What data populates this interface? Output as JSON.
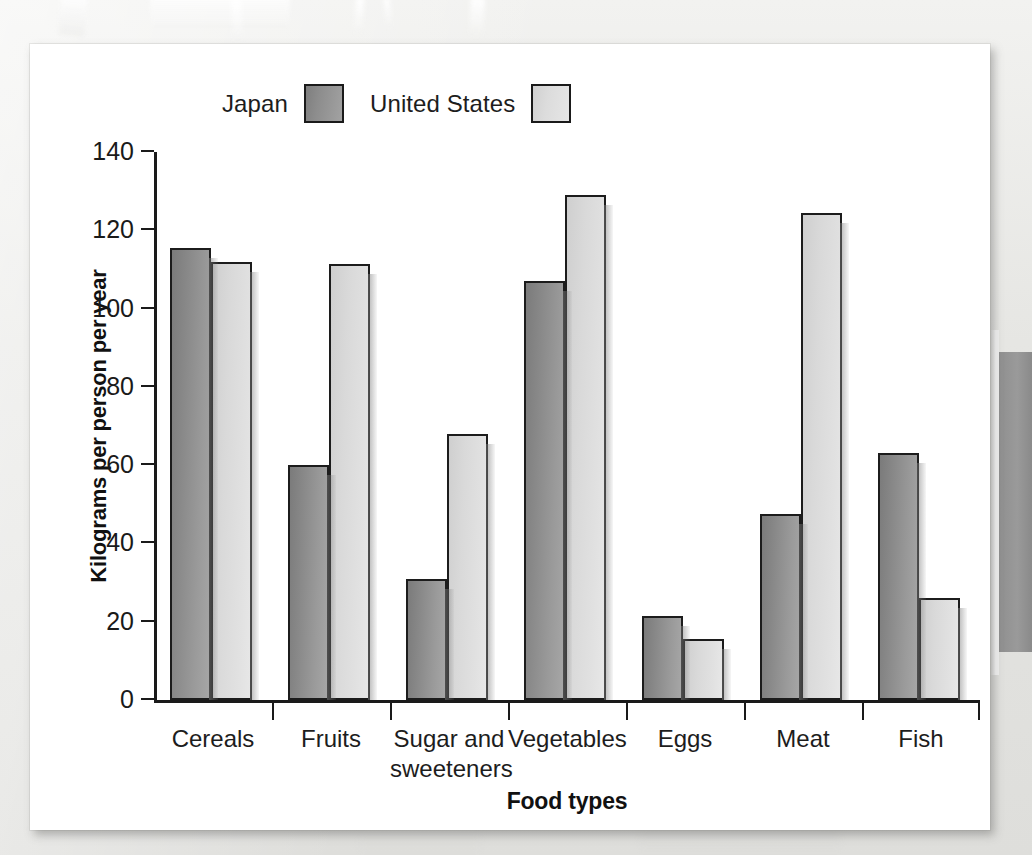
{
  "figure": {
    "background_color": "#e9e9e7",
    "card_color": "#ffffff"
  },
  "legend": {
    "entries": [
      {
        "label": "Japan",
        "color": "#8d8d8d",
        "swatch_name": "japan-swatch"
      },
      {
        "label": "United States",
        "color": "#dcdcdc",
        "swatch_name": "united-states-swatch"
      }
    ]
  },
  "axes": {
    "ylabel": "Kilograms per person per year",
    "xlabel": "Food types",
    "yticks": [
      "0",
      "20",
      "40",
      "60",
      "80",
      "100",
      "120",
      "140"
    ]
  },
  "chart_data": {
    "type": "bar",
    "title": "",
    "xlabel": "Food types",
    "ylabel": "Kilograms per person per year",
    "ylim": [
      0,
      140
    ],
    "ytick_step": 20,
    "grid": false,
    "legend_position": "top",
    "categories": [
      "Cereals",
      "Fruits",
      "Sugar and\nsweeteners",
      "Vegetables",
      "Eggs",
      "Meat",
      "Fish"
    ],
    "series": [
      {
        "name": "Japan",
        "color": "#8d8d8d",
        "values": [
          115.5,
          60,
          31,
          107,
          21.5,
          47.5,
          63
        ]
      },
      {
        "name": "United States",
        "color": "#dcdcdc",
        "values": [
          112,
          111.5,
          68,
          129,
          15.5,
          124.5,
          26
        ]
      }
    ]
  }
}
